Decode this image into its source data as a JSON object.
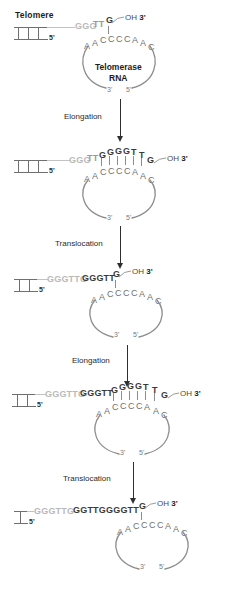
{
  "figure": {
    "title_label": "Telomere",
    "enzyme_label_line1": "Telomerase",
    "enzyme_label_line2": "RNA",
    "oh_label": "OH",
    "three_prime": "3'",
    "five_prime": "5'",
    "rna_three_prime": "3'",
    "rna_five_prime": "5'",
    "steps": [
      {
        "label": "Elongation"
      },
      {
        "label": "Translocation"
      },
      {
        "label": "Elongation"
      },
      {
        "label": "Translocation"
      }
    ],
    "template_sequence": "AACCCCAAC",
    "colors": {
      "old_dna": "#b9b9b9",
      "mid_dna": "#9a9a9a",
      "new_dna": "#3a3a3a",
      "template_rna": "#6f6f6f",
      "arrow": "#2f2f2f",
      "loop": "#8d8d8d",
      "background": "#ffffff"
    },
    "panels": [
      {
        "name": "panel-initial",
        "rungs": 3,
        "old_segment": "GGG",
        "mid_segment": "TT",
        "paired_top": "G",
        "template": "AACCCCAAC",
        "bonds": 1
      },
      {
        "name": "panel-after-elongation-1",
        "rungs": 3,
        "old_segment": "GGG",
        "mid_segment": "TT",
        "paired_top": "GGGGTT",
        "tail": "G",
        "template": "AACCCCAAC",
        "bonds": 6
      },
      {
        "name": "panel-after-translocation-1",
        "rungs": 2,
        "old_segment": "GGGTTG",
        "mid_segment": "GGGTT",
        "paired_top": "G",
        "template": "AACCCCAAC",
        "bonds": 1
      },
      {
        "name": "panel-after-elongation-2",
        "rungs": 2,
        "old_segment": "GGGTTG",
        "mid_segment": "GGGTT",
        "paired_top": "GGGGTT",
        "tail": "G",
        "template": "AACCCCAAC",
        "bonds": 6
      },
      {
        "name": "panel-after-translocation-2",
        "rungs": 1,
        "old_segment": "GGGTTG",
        "mid_segment": "GGTTGGGGTT",
        "paired_top": "G",
        "template": "AACCCCAAC",
        "bonds": 1
      }
    ]
  }
}
